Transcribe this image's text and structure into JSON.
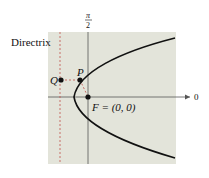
{
  "diagram": {
    "labels": {
      "directrix": "Directrix",
      "pi_num": "π",
      "pi_den": "2",
      "zero": "0",
      "Q": "Q",
      "P": "P",
      "F": "F = (0, 0)"
    },
    "colors": {
      "panel": "#e3e4da",
      "curve": "#111111",
      "axis": "#555555",
      "directrix": "#c0504d",
      "dashed": "#c0504d"
    }
  }
}
